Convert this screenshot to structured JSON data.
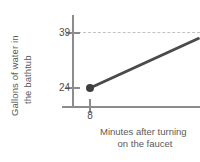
{
  "chart_data": {
    "type": "line",
    "title": "",
    "xlabel": "Minutes after turning on the faucet",
    "ylabel": "Gallons of water in the bathtub",
    "xlabel_lines": [
      "Minutes after turning",
      "on the faucet"
    ],
    "ylabel_lines": [
      "Gallons of water in",
      "the bathtub"
    ],
    "x_ticks": [
      8
    ],
    "x_tick_labels": [
      "8"
    ],
    "y_ticks": [
      24,
      39
    ],
    "y_tick_labels": [
      "24",
      "39"
    ],
    "xlim": [
      6,
      28
    ],
    "ylim": [
      16,
      44
    ],
    "grid": "horizontal-dashed-at-39",
    "gridlines": [
      39
    ],
    "legend": "none",
    "series": [
      {
        "name": "water in bathtub",
        "points": [
          [
            8,
            24
          ],
          [
            27,
            37.5
          ]
        ],
        "start_marker": "filled-circle",
        "start_point": [
          8,
          24
        ],
        "end_clipped_at_right_edge": true,
        "color": "#4a4a4a"
      }
    ],
    "annotations": [],
    "colors": {
      "line": "#4a4a4a",
      "marker": "#3f3f3f",
      "axis": "#8c8c8c",
      "gridline": "#c2c2c2",
      "text": "#5a5a5a",
      "background": "#ffffff"
    }
  }
}
